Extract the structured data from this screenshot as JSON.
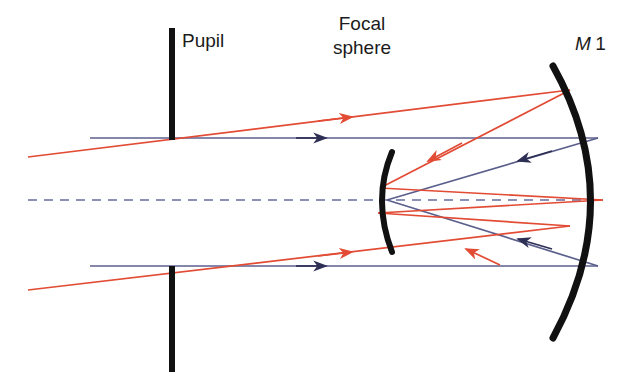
{
  "figure": {
    "type": "optical-ray-diagram",
    "background_color": "#ffffff",
    "width": 632,
    "height": 390,
    "labels": {
      "pupil": "Pupil",
      "focal_sphere_line1": "Focal",
      "focal_sphere_line2": "sphere",
      "mirror_m": "M",
      "mirror_index": "1"
    },
    "colors": {
      "red_ray": "#e24b34",
      "blue_ray": "#5b5f8c",
      "optical_element": "#111111",
      "axis_dashed": "#8b90b4",
      "text": "#1b1b1b"
    },
    "elements": [
      {
        "name": "pupil-stop",
        "kind": "aperture-stop",
        "orientation": "vertical",
        "x": 172,
        "top_segment_y": [
          28,
          140
        ],
        "bottom_segment_y": [
          266,
          372
        ],
        "stroke_width": 6
      },
      {
        "name": "focal-sphere-arc",
        "kind": "curved-surface",
        "vertex_x": 387,
        "center_y": 200,
        "half_height": 52,
        "curvature": "convex-left",
        "stroke_width": 6
      },
      {
        "name": "m1-mirror-arc",
        "kind": "concave-mirror",
        "vertex_x": 603,
        "center_y": 200,
        "half_height": 138,
        "curvature": "concave-left",
        "stroke_width": 7
      },
      {
        "name": "optical-axis",
        "kind": "dashed-axis",
        "y": 200,
        "x_from": 28,
        "x_to": 603
      }
    ],
    "rays": {
      "on_axis_blue": {
        "color_key": "blue_ray",
        "description": "Axial (on-axis) bundle: horizontal incoming rays reflected back to axial focus",
        "incoming": [
          {
            "from": [
              90,
              138
            ],
            "to": [
              598,
              138
            ]
          },
          {
            "from": [
              90,
              266
            ],
            "to": [
              598,
              266
            ]
          }
        ],
        "reflected": [
          {
            "from": [
              598,
              138
            ],
            "to": [
              387,
              200
            ]
          },
          {
            "from": [
              598,
              266
            ],
            "to": [
              387,
              200
            ]
          }
        ],
        "arrowheads": [
          {
            "at": [
              322,
              138
            ],
            "direction": "right"
          },
          {
            "at": [
              322,
              266
            ],
            "direction": "right"
          },
          {
            "at": [
              522,
              157
            ],
            "direction": "left"
          },
          {
            "at": [
              522,
              247
            ],
            "direction": "left"
          }
        ]
      },
      "off_axis_red": {
        "color_key": "red_ray",
        "description": "Off-axis (tilted) bundle: oblique incoming rays reflected to off-axis focus on the focal sphere",
        "incoming": [
          {
            "from": [
              28,
              157
            ],
            "to": [
              570,
              90
            ]
          },
          {
            "from": [
              28,
              290
            ],
            "to": [
              570,
              226
            ]
          }
        ],
        "reflected": [
          {
            "from": [
              570,
              90
            ],
            "to": [
              380,
              188
            ]
          },
          {
            "from": [
              380,
              188
            ],
            "to": [
              603,
              200
            ]
          },
          {
            "from": [
              570,
              226
            ],
            "to": [
              378,
              213
            ]
          }
        ],
        "arrowheads": [
          {
            "at": [
              348,
              112
            ],
            "direction": "right"
          },
          {
            "at": [
              348,
              242
            ],
            "direction": "right"
          },
          {
            "at": [
              430,
              150
            ],
            "direction": "left-down"
          },
          {
            "at": [
              462,
              183
            ],
            "direction": "left-up"
          },
          {
            "at": [
              478,
              196
            ],
            "direction": "left"
          }
        ]
      }
    },
    "annotations": [
      {
        "name": "pupil-label",
        "text": "Pupil",
        "x": 182,
        "y": 47
      },
      {
        "name": "focal-sphere-label",
        "text": "Focal sphere",
        "x": 362,
        "y": 30
      },
      {
        "name": "m1-label",
        "text": "M1",
        "x": 577,
        "y": 50
      }
    ]
  }
}
